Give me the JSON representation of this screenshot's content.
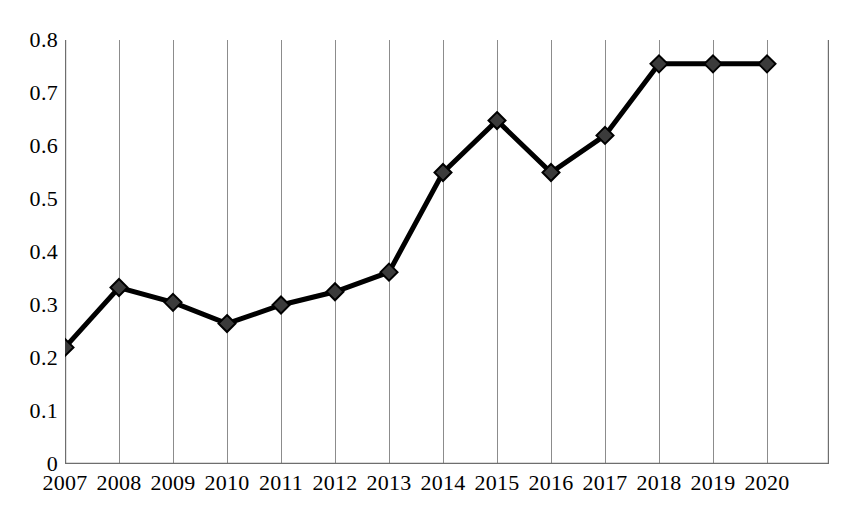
{
  "chart_data": {
    "type": "line",
    "title": "",
    "subtitle": "",
    "xlabel": "",
    "ylabel": "",
    "categories": [
      "2007",
      "2008",
      "2009",
      "2010",
      "2011",
      "2012",
      "2013",
      "2014",
      "2015",
      "2016",
      "2017",
      "2018",
      "2019",
      "2020"
    ],
    "values": [
      0.22,
      0.333,
      0.305,
      0.265,
      0.3,
      0.325,
      0.362,
      0.55,
      0.648,
      0.55,
      0.62,
      0.755,
      0.755,
      0.755
    ],
    "series": [
      {
        "name": "",
        "values": [
          0.22,
          0.333,
          0.305,
          0.265,
          0.3,
          0.325,
          0.362,
          0.55,
          0.648,
          0.55,
          0.62,
          0.755,
          0.755,
          0.755
        ],
        "marker": "diamond",
        "marker_color": "#3b3b3b",
        "line_color": "#000000"
      }
    ],
    "ylim": [
      0,
      0.8
    ],
    "y_ticks": [
      0,
      0.1,
      0.2,
      0.3,
      0.4,
      0.5,
      0.6,
      0.7,
      0.8
    ],
    "y_tick_labels": [
      "0",
      "0.1",
      "0.2",
      "0.3",
      "0.4",
      "0.5",
      "0.6",
      "0.7",
      "0.8"
    ],
    "x_tick_labels": [
      "2007",
      "2008",
      "2009",
      "2010",
      "2011",
      "2012",
      "2013",
      "2014",
      "2015",
      "2016",
      "2017",
      "2018",
      "2019",
      "2020"
    ],
    "grid": {
      "vertical": true,
      "horizontal": false,
      "color": "#8c8c8c"
    },
    "legend": {
      "visible": false,
      "position": "none",
      "entries": []
    },
    "annotations": [],
    "axes": {
      "left_axis_line": true,
      "bottom_axis_line": true,
      "top_axis_line": false,
      "right_axis_line": false,
      "axis_color": "#6e6e6e"
    }
  }
}
